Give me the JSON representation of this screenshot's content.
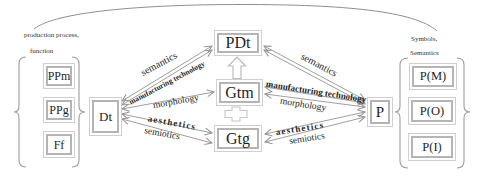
{
  "colors": {
    "background": "#ffffff",
    "connector_line": "#949494",
    "box_border_inner": "#b5b5b5",
    "box_border_outer": "#cfcfcf",
    "brace": "#9c9c9c",
    "text": "#1f1f1f"
  },
  "left_group": {
    "caption_line1": "production process,",
    "caption_line2": "function",
    "boxes": [
      "PPm",
      "PPg",
      "Ff"
    ]
  },
  "nodes": {
    "dt": "Dt",
    "pdt": "PDt",
    "gtm": "Gtm",
    "gtg": "Gtg",
    "p": "P"
  },
  "right_group": {
    "caption_line1": "Symbols,",
    "caption_line2": "Semantics",
    "boxes": [
      "P(M)",
      "P(O)",
      "P(I)"
    ]
  },
  "edge_labels": {
    "left_semantics": "semantics",
    "left_manufacturing_technology": "manufacturing technology",
    "left_morphology": "morphology",
    "left_aesthetics": "aesthetics",
    "left_semiotics": "semiotics",
    "right_semantics": "semantics",
    "right_manufacturing_technology": "manufacturing technology",
    "right_morphology": "morphology",
    "right_aesthetics": "aesthetics",
    "right_semiotics": "semiotics"
  },
  "icons": {
    "block_arrow_up": "gtm-to-pdt-block-arrow",
    "plus_connector": "gtm-gtg-plus-connector"
  }
}
